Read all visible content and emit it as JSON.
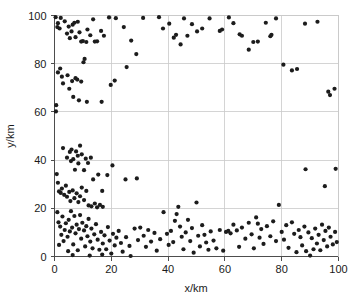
{
  "chart_data": {
    "type": "scatter",
    "title": "",
    "xlabel": "x/km",
    "ylabel": "y/km",
    "xlim": [
      0,
      100
    ],
    "ylim": [
      0,
      100
    ],
    "xticks": [
      0,
      20,
      40,
      60,
      80,
      100
    ],
    "yticks": [
      0,
      20,
      40,
      60,
      80,
      100
    ],
    "xticklabels": [
      "0",
      "20",
      "40",
      "60",
      "80",
      "100"
    ],
    "yticklabels": [
      "0",
      "20",
      "40",
      "60",
      "80",
      "100"
    ],
    "grid": true,
    "grid_color": "#c9c9c9",
    "legend": false,
    "marker": "filled-circle",
    "marker_color": "#1c1c1c",
    "marker_size": 2.1,
    "series": [
      {
        "name": "nodes",
        "points": [
          [
            0.4,
            99.3
          ],
          [
            1.2,
            96.8
          ],
          [
            1.0,
            95.2
          ],
          [
            1.8,
            94.6
          ],
          [
            2.2,
            99.0
          ],
          [
            3.6,
            97.6
          ],
          [
            4.4,
            92.5
          ],
          [
            5.0,
            95.4
          ],
          [
            5.4,
            90.6
          ],
          [
            6.0,
            93.4
          ],
          [
            6.4,
            96.2
          ],
          [
            7.0,
            97.0
          ],
          [
            7.4,
            91.0
          ],
          [
            8.2,
            97.4
          ],
          [
            8.8,
            93.0
          ],
          [
            9.4,
            89.2
          ],
          [
            10.0,
            89.4
          ],
          [
            11.2,
            89.0
          ],
          [
            11.6,
            94.2
          ],
          [
            12.6,
            91.8
          ],
          [
            13.6,
            98.4
          ],
          [
            14.2,
            89.2
          ],
          [
            15.0,
            89.3
          ],
          [
            16.4,
            93.6
          ],
          [
            17.4,
            91.6
          ],
          [
            19.2,
            99.2
          ],
          [
            21.6,
            98.9
          ],
          [
            2.0,
            78.0
          ],
          [
            1.2,
            76.4
          ],
          [
            2.6,
            74.6
          ],
          [
            3.0,
            71.8
          ],
          [
            4.6,
            75.2
          ],
          [
            5.2,
            69.6
          ],
          [
            6.2,
            72.8
          ],
          [
            6.6,
            66.2
          ],
          [
            7.4,
            74.0
          ],
          [
            8.0,
            73.4
          ],
          [
            8.6,
            64.8
          ],
          [
            9.4,
            72.6
          ],
          [
            10.2,
            80.6
          ],
          [
            10.6,
            82.0
          ],
          [
            11.4,
            64.2
          ],
          [
            0.6,
            62.8
          ],
          [
            0.5,
            60.2
          ],
          [
            24.4,
            95.2
          ],
          [
            27.0,
            89.6
          ],
          [
            28.8,
            84.0
          ],
          [
            31.2,
            99.0
          ],
          [
            25.4,
            78.6
          ],
          [
            21.2,
            73.0
          ],
          [
            19.8,
            71.2
          ],
          [
            16.6,
            64.2
          ],
          [
            36.8,
            99.3
          ],
          [
            38.2,
            94.6
          ],
          [
            40.4,
            96.6
          ],
          [
            42.0,
            90.8
          ],
          [
            42.8,
            92.0
          ],
          [
            44.4,
            88.0
          ],
          [
            45.6,
            98.8
          ],
          [
            46.8,
            91.6
          ],
          [
            48.4,
            96.4
          ],
          [
            50.2,
            93.4
          ],
          [
            52.0,
            94.6
          ],
          [
            54.6,
            98.8
          ],
          [
            58.2,
            93.6
          ],
          [
            59.0,
            94.2
          ],
          [
            61.4,
            99.2
          ],
          [
            63.0,
            96.8
          ],
          [
            65.2,
            92.2
          ],
          [
            66.0,
            91.6
          ],
          [
            68.4,
            85.8
          ],
          [
            70.0,
            89.0
          ],
          [
            71.6,
            89.2
          ],
          [
            74.4,
            97.0
          ],
          [
            76.0,
            91.4
          ],
          [
            76.4,
            92.0
          ],
          [
            78.0,
            98.8
          ],
          [
            80.6,
            79.6
          ],
          [
            83.6,
            77.2
          ],
          [
            85.4,
            77.8
          ],
          [
            88.2,
            96.6
          ],
          [
            92.6,
            97.4
          ],
          [
            96.4,
            68.4
          ],
          [
            97.0,
            67.0
          ],
          [
            98.6,
            69.6
          ],
          [
            3.0,
            45.0
          ],
          [
            4.4,
            41.0
          ],
          [
            5.4,
            43.4
          ],
          [
            5.8,
            39.6
          ],
          [
            6.0,
            44.4
          ],
          [
            6.6,
            40.4
          ],
          [
            7.2,
            36.0
          ],
          [
            7.6,
            43.6
          ],
          [
            8.2,
            41.8
          ],
          [
            8.4,
            38.6
          ],
          [
            9.0,
            46.0
          ],
          [
            9.6,
            42.4
          ],
          [
            10.4,
            35.8
          ],
          [
            11.0,
            40.6
          ],
          [
            11.8,
            38.8
          ],
          [
            12.8,
            41.0
          ],
          [
            0.8,
            34.2
          ],
          [
            1.2,
            30.6
          ],
          [
            1.6,
            27.0
          ],
          [
            2.2,
            26.4
          ],
          [
            2.6,
            28.2
          ],
          [
            3.4,
            25.6
          ],
          [
            4.0,
            29.4
          ],
          [
            4.4,
            24.8
          ],
          [
            5.2,
            26.8
          ],
          [
            5.6,
            23.0
          ],
          [
            6.4,
            27.4
          ],
          [
            7.0,
            24.2
          ],
          [
            7.8,
            26.2
          ],
          [
            8.4,
            22.6
          ],
          [
            9.0,
            25.0
          ],
          [
            9.6,
            28.6
          ],
          [
            10.4,
            23.4
          ],
          [
            11.2,
            27.2
          ],
          [
            12.0,
            21.2
          ],
          [
            13.0,
            20.8
          ],
          [
            14.2,
            22.0
          ],
          [
            15.0,
            20.4
          ],
          [
            16.0,
            21.4
          ],
          [
            17.0,
            20.6
          ],
          [
            13.6,
            32.0
          ],
          [
            15.4,
            34.0
          ],
          [
            16.8,
            27.2
          ],
          [
            18.6,
            33.8
          ],
          [
            20.4,
            37.8
          ],
          [
            25.0,
            32.0
          ],
          [
            29.0,
            32.4
          ],
          [
            1.0,
            18.4
          ],
          [
            1.4,
            14.2
          ],
          [
            2.0,
            12.4
          ],
          [
            2.4,
            9.0
          ],
          [
            2.8,
            16.6
          ],
          [
            3.2,
            6.4
          ],
          [
            3.6,
            11.0
          ],
          [
            4.0,
            13.8
          ],
          [
            4.6,
            8.2
          ],
          [
            5.0,
            15.2
          ],
          [
            5.4,
            10.4
          ],
          [
            5.8,
            18.8
          ],
          [
            6.2,
            12.0
          ],
          [
            6.6,
            5.0
          ],
          [
            7.0,
            16.8
          ],
          [
            7.4,
            9.6
          ],
          [
            7.8,
            13.2
          ],
          [
            8.2,
            2.6
          ],
          [
            8.6,
            11.4
          ],
          [
            9.0,
            17.2
          ],
          [
            9.4,
            7.4
          ],
          [
            9.8,
            14.0
          ],
          [
            10.4,
            10.8
          ],
          [
            10.8,
            4.2
          ],
          [
            11.2,
            12.6
          ],
          [
            11.6,
            8.4
          ],
          [
            12.0,
            15.6
          ],
          [
            12.6,
            6.2
          ],
          [
            13.0,
            11.6
          ],
          [
            13.4,
            3.4
          ],
          [
            14.0,
            9.2
          ],
          [
            14.6,
            13.4
          ],
          [
            15.2,
            7.0
          ],
          [
            15.8,
            2.8
          ],
          [
            16.4,
            10.2
          ],
          [
            17.0,
            5.4
          ],
          [
            17.6,
            8.8
          ],
          [
            18.2,
            3.0
          ],
          [
            18.8,
            12.2
          ],
          [
            19.4,
            6.6
          ],
          [
            20.0,
            1.2
          ],
          [
            20.6,
            9.4
          ],
          [
            21.2,
            4.6
          ],
          [
            21.8,
            7.8
          ],
          [
            22.6,
            10.6
          ],
          [
            1.6,
            4.8
          ],
          [
            4.8,
            2.2
          ],
          [
            6.4,
            0.6
          ],
          [
            12.4,
            0.4
          ],
          [
            16.8,
            0.8
          ],
          [
            23.4,
            5.6
          ],
          [
            24.0,
            2.0
          ],
          [
            25.2,
            8.0
          ],
          [
            26.4,
            4.4
          ],
          [
            26.8,
            0.2
          ],
          [
            28.2,
            11.6
          ],
          [
            29.4,
            6.8
          ],
          [
            30.2,
            12.0
          ],
          [
            31.4,
            8.6
          ],
          [
            32.2,
            4.0
          ],
          [
            33.0,
            11.0
          ],
          [
            34.0,
            6.2
          ],
          [
            35.2,
            9.8
          ],
          [
            36.0,
            2.4
          ],
          [
            37.2,
            7.2
          ],
          [
            38.4,
            18.4
          ],
          [
            39.6,
            9.4
          ],
          [
            40.2,
            4.8
          ],
          [
            41.0,
            10.6
          ],
          [
            41.8,
            6.0
          ],
          [
            42.4,
            14.8
          ],
          [
            43.0,
            17.6
          ],
          [
            43.6,
            20.6
          ],
          [
            44.2,
            12.4
          ],
          [
            44.8,
            8.2
          ],
          [
            45.4,
            3.0
          ],
          [
            46.2,
            10.0
          ],
          [
            47.0,
            15.2
          ],
          [
            47.8,
            6.4
          ],
          [
            48.4,
            11.8
          ],
          [
            49.0,
            1.6
          ],
          [
            50.0,
            22.4
          ],
          [
            50.6,
            8.6
          ],
          [
            51.2,
            4.2
          ],
          [
            52.0,
            13.0
          ],
          [
            52.8,
            9.0
          ],
          [
            53.4,
            5.8
          ],
          [
            54.2,
            2.8
          ],
          [
            55.0,
            10.4
          ],
          [
            56.0,
            6.6
          ],
          [
            57.0,
            3.4
          ],
          [
            58.2,
            11.0
          ],
          [
            59.4,
            2.4
          ],
          [
            60.4,
            10.2
          ],
          [
            61.2,
            10.6
          ],
          [
            62.0,
            9.6
          ],
          [
            63.0,
            13.2
          ],
          [
            64.2,
            10.8
          ],
          [
            65.0,
            4.0
          ],
          [
            66.0,
            12.0
          ],
          [
            67.2,
            7.4
          ],
          [
            68.4,
            14.0
          ],
          [
            69.4,
            9.2
          ],
          [
            70.2,
            3.4
          ],
          [
            71.0,
            16.2
          ],
          [
            71.6,
            13.6
          ],
          [
            72.2,
            7.8
          ],
          [
            72.8,
            11.4
          ],
          [
            73.6,
            5.2
          ],
          [
            74.8,
            12.6
          ],
          [
            76.0,
            8.4
          ],
          [
            77.0,
            14.6
          ],
          [
            78.0,
            6.4
          ],
          [
            79.0,
            21.4
          ],
          [
            80.0,
            10.2
          ],
          [
            80.8,
            7.0
          ],
          [
            81.6,
            13.0
          ],
          [
            82.4,
            3.6
          ],
          [
            83.6,
            14.2
          ],
          [
            84.4,
            9.4
          ],
          [
            85.2,
            1.8
          ],
          [
            86.0,
            11.0
          ],
          [
            86.6,
            8.0
          ],
          [
            87.2,
            4.6
          ],
          [
            88.0,
            12.4
          ],
          [
            88.6,
            2.2
          ],
          [
            89.4,
            10.0
          ],
          [
            90.0,
            0.4
          ],
          [
            90.6,
            7.6
          ],
          [
            91.2,
            3.0
          ],
          [
            91.8,
            11.6
          ],
          [
            92.4,
            5.4
          ],
          [
            93.0,
            9.0
          ],
          [
            93.6,
            2.6
          ],
          [
            94.2,
            13.2
          ],
          [
            94.8,
            6.8
          ],
          [
            95.4,
            10.6
          ],
          [
            96.0,
            4.2
          ],
          [
            96.6,
            12.0
          ],
          [
            97.2,
            8.2
          ],
          [
            98.0,
            5.0
          ],
          [
            98.8,
            10.2
          ],
          [
            99.4,
            6.0
          ],
          [
            88.4,
            36.2
          ],
          [
            95.2,
            29.2
          ],
          [
            99.0,
            36.4
          ]
        ]
      }
    ]
  },
  "figure": {
    "background": "#ffffff",
    "axis_color": "#4d4d4d",
    "text_color": "#1a1a1a"
  }
}
